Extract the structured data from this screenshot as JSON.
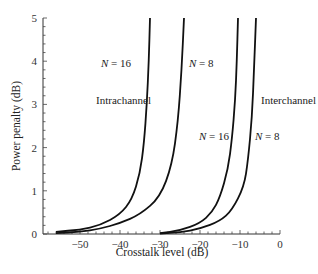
{
  "chart_data": {
    "type": "line",
    "title": "",
    "xlabel": "Crosstalk level (dB)",
    "ylabel": "Power penalty (dB)",
    "xlim": [
      -60,
      0
    ],
    "ylim": [
      0,
      5
    ],
    "x_ticks": [
      -50,
      -40,
      -30,
      -20,
      -10,
      0
    ],
    "x_tick_labels": [
      "−50",
      "−40",
      "−30",
      "−20",
      "−10",
      "0"
    ],
    "y_ticks": [
      0,
      1,
      2,
      3,
      4,
      5
    ],
    "y_tick_labels": [
      "0",
      "1",
      "2",
      "3",
      "4",
      "5"
    ],
    "grid": false,
    "legend": null,
    "series": [
      {
        "name": "Intrachannel, N = 16",
        "x": [
          -56,
          -50,
          -45,
          -40,
          -37,
          -35,
          -34,
          -33.3,
          -32.8,
          -32.5
        ],
        "y": [
          0.05,
          0.1,
          0.2,
          0.45,
          0.8,
          1.4,
          2.1,
          3.0,
          4.0,
          5.0
        ]
      },
      {
        "name": "Intrachannel, N = 8",
        "x": [
          -56,
          -50,
          -45,
          -40,
          -35,
          -30,
          -27,
          -25.5,
          -24.6,
          -24
        ],
        "y": [
          0.02,
          0.05,
          0.12,
          0.25,
          0.45,
          0.85,
          1.6,
          2.6,
          3.8,
          5.0
        ]
      },
      {
        "name": "Interchannel, N = 16",
        "x": [
          -30,
          -25,
          -20,
          -17,
          -15,
          -13,
          -12,
          -11.2,
          -10.8,
          -10.5
        ],
        "y": [
          0.02,
          0.08,
          0.25,
          0.5,
          0.85,
          1.5,
          2.2,
          3.1,
          4.0,
          5.0
        ]
      },
      {
        "name": "Interchannel, N = 8",
        "x": [
          -30,
          -25,
          -20,
          -15,
          -12,
          -9,
          -8,
          -7,
          -6.5,
          -6
        ],
        "y": [
          0.01,
          0.04,
          0.12,
          0.3,
          0.55,
          1.1,
          1.7,
          2.7,
          3.8,
          5.0
        ]
      }
    ],
    "annotations": [
      {
        "text": "N = 16",
        "x": -37,
        "y": 4.0
      },
      {
        "text": "N = 8",
        "x": -21,
        "y": 4.0
      },
      {
        "text": "Intrachannel",
        "x": -44,
        "y": 3.2
      },
      {
        "text": "Interchannel",
        "x": -3,
        "y": 3.2
      },
      {
        "text": "N = 16",
        "x": -16,
        "y": 2.4
      },
      {
        "text": "N = 8",
        "x": -5,
        "y": 2.4
      }
    ]
  },
  "labels": {
    "xlabel": "Crosstalk level (dB)",
    "ylabel": "Power penalty (dB)",
    "intra": "Intrachannel",
    "inter": "Interchannel",
    "n16": "N = 16",
    "n8": "N = 8"
  }
}
